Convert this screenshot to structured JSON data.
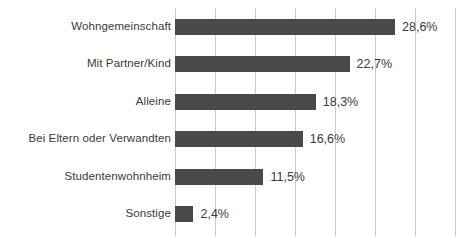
{
  "chart_data": {
    "type": "bar",
    "orientation": "horizontal",
    "title": "",
    "subtitle": "",
    "xlabel": "",
    "ylabel": "",
    "categories": [
      "Wohngemeinschaft",
      "Mit Partner/Kind",
      "Alleine",
      "Bei Eltern oder Verwandten",
      "Studentenwohnheim",
      "Sonstige"
    ],
    "values": [
      28.6,
      22.7,
      18.3,
      16.6,
      11.5,
      2.4
    ],
    "value_labels": [
      "28,6%",
      "22,7%",
      "18,3%",
      "16,6%",
      "11,5%",
      "2,4%"
    ],
    "xlim": [
      0,
      36.4
    ],
    "xticks": [
      0,
      5.2,
      10.4,
      15.6,
      20.8,
      26,
      31.2,
      36.4
    ],
    "xtick_labels": [],
    "grid": true,
    "grid_axis": "x",
    "legend": false,
    "bar_color": "#4a4a4a",
    "grid_color": "#c9c9c9",
    "background_color": "#ffffff",
    "text_color": "#3a3a3a"
  }
}
